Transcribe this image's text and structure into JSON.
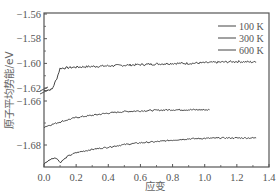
{
  "chart_data": {
    "type": "line",
    "title": "",
    "xlabel": "应变",
    "ylabel": "原子平均势能/eV",
    "xlim": [
      0.0,
      1.4
    ],
    "ylim": [
      -1.69,
      -1.56
    ],
    "y_axis_break": {
      "between": [
        -1.62,
        -1.66
      ]
    },
    "xticks": [
      "0.0",
      "0.2",
      "0.4",
      "0.6",
      "0.8",
      "1.0",
      "1.2",
      "1.4"
    ],
    "yticks": [
      "-1.56",
      "-1.58",
      "-1.60",
      "-1.62",
      "-1.66",
      "-1.68"
    ],
    "grid": false,
    "legend": {
      "position": "upper right",
      "entries": [
        "100 K",
        "300 K",
        "600 K"
      ]
    },
    "series": [
      {
        "name": "100 K",
        "x": [
          0.0,
          0.05,
          0.08,
          0.1,
          0.15,
          0.2,
          0.3,
          0.4,
          0.5,
          0.6,
          0.7,
          0.8,
          0.9,
          1.0,
          1.1,
          1.2,
          1.32
        ],
        "y": [
          -1.622,
          -1.621,
          -1.612,
          -1.604,
          -1.6035,
          -1.603,
          -1.6025,
          -1.602,
          -1.6015,
          -1.601,
          -1.6005,
          -1.6,
          -1.6,
          -1.5995,
          -1.599,
          -1.5985,
          -1.599
        ]
      },
      {
        "name": "300 K",
        "x": [
          0.0,
          0.1,
          0.2,
          0.3,
          0.4,
          0.5,
          0.6,
          0.7,
          0.8,
          0.9,
          1.03
        ],
        "y": [
          -1.6718,
          -1.6695,
          -1.6675,
          -1.6665,
          -1.6655,
          -1.6648,
          -1.6645,
          -1.6642,
          -1.664,
          -1.664,
          -1.664
        ]
      },
      {
        "name": "600 K",
        "x": [
          0.0,
          0.05,
          0.08,
          0.1,
          0.15,
          0.2,
          0.3,
          0.4,
          0.5,
          0.6,
          0.7,
          0.8,
          0.9,
          1.0,
          1.1,
          1.2,
          1.32
        ],
        "y": [
          -1.6885,
          -1.686,
          -1.686,
          -1.688,
          -1.685,
          -1.6835,
          -1.682,
          -1.681,
          -1.6798,
          -1.679,
          -1.6785,
          -1.6778,
          -1.6772,
          -1.677,
          -1.6768,
          -1.6768,
          -1.6768
        ]
      }
    ]
  }
}
